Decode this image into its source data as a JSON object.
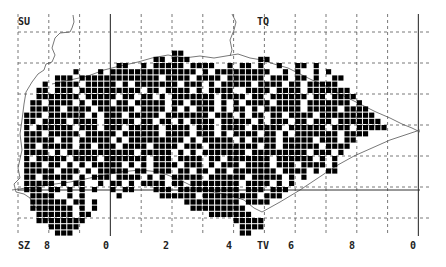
{
  "map": {
    "title": "",
    "grid_labels": {
      "top_left": "SU",
      "top_right": "TQ",
      "bottom_left": "SZ",
      "bottom_right": "TV"
    },
    "x_tick_labels": [
      {
        "text": "8",
        "x": 47
      },
      {
        "text": "0",
        "x": 106
      },
      {
        "text": "2",
        "x": 166
      },
      {
        "text": "4",
        "x": 229
      },
      {
        "text": "6",
        "x": 291
      },
      {
        "text": "8",
        "x": 352
      },
      {
        "text": "0",
        "x": 413
      }
    ],
    "colors": {
      "present": "#000000",
      "grid_dashed": "#555555",
      "grid_solid": "#444444",
      "coast": "#555555",
      "background": "#ffffff"
    },
    "grid": {
      "origin_x": 18,
      "origin_y": 32,
      "square_px_x": 30.8,
      "square_px_y": 31,
      "cells_per_square": 5,
      "vertical_lines": 14,
      "horizontal_lines": 7,
      "solid_vertical_index": [
        3,
        13
      ],
      "solid_horizontal_y": 191
    },
    "tetrad_rows": [
      {
        "row": 3,
        "start": 25,
        "cells": "##"
      },
      {
        "row": 4,
        "start": 22,
        "cells": "##.###...........##"
      },
      {
        "row": 5,
        "start": 14,
        "cells": "..##..#.#####.####..#.##.#..#..##.#"
      },
      {
        "row": 6,
        "start": 9,
        "cells": "#...#.##############.#.#########..#.#..#.#"
      },
      {
        "row": 7,
        "start": 6,
        "cells": "###.#############.####.####.######.###.##.#..##"
      },
      {
        "row": 8,
        "start": 4,
        "cells": "#.####.#####.#.#######.###.#.#####.####.##.#####"
      },
      {
        "row": 9,
        "start": 3,
        "cells": "##.###.##########.##.####.#.####..####.####.#######"
      },
      {
        "row": 10,
        "start": 3,
        "cells": "#######.#####.##.##.#.#######.####.##.######.##.####"
      },
      {
        "row": 11,
        "start": 2,
        "cells": "##.####.#.###.##.#####.##.####.#.#.####.####.#######.#"
      },
      {
        "row": 12,
        "start": 2,
        "cells": "#####.####.######.####.#.#.###.#.##.#.######.#####.####"
      },
      {
        "row": 13,
        "start": 1,
        "cells": "###.######.#.###.#####.#######.###.#.##.##.####.#########"
      },
      {
        "row": 14,
        "start": 1,
        "cells": "##.####.####.#####.##.##.#.####.#####.#.###.##.###.#######"
      },
      {
        "row": 15,
        "start": 1,
        "cells": "#.######.###.###.#####.####.###.####.#####.######.###.#####"
      },
      {
        "row": 16,
        "start": 1,
        "cells": "###.#####.#####.######.####.###.#.####.##.#.#######.####"
      },
      {
        "row": 17,
        "start": 1,
        "cells": "#####.##.#####.#.#########.#.#####.#.####.#####.###.##"
      },
      {
        "row": 18,
        "start": 1,
        "cells": "##.#####.##.###.####.####.###.########.##.######.####"
      },
      {
        "row": 19,
        "start": 1,
        "cells": "####.#.###########.#####.#.#.#######.#########.###.#"
      },
      {
        "row": 20,
        "start": 1,
        "cells": "#.#####.####.#######.###.####.##.#######.######.#.#"
      },
      {
        "row": 21,
        "start": 1,
        "cells": "###.##.#.#.#####.#.#.####.###.#.###.####.###.####.#"
      },
      {
        "row": 22,
        "start": 1,
        "cells": "#####.###.#.#####.##.###.##.##.##.#######.####.#.##"
      },
      {
        "row": 23,
        "start": 1,
        "cells": "##.#####.#.###.####.#.#.#####.######.#####.#.#"
      },
      {
        "row": 24,
        "start": 1,
        "cells": "#####.#.##..#.##.#.####.##.########.####.#.#"
      },
      {
        "row": 25,
        "start": 1,
        "cells": "###.##.#.#.#..#.##...###.##########.###.###"
      },
      {
        "row": 26,
        "start": 2,
        "cells": "####..#.#.....#......######.#########.###"
      },
      {
        "row": 27,
        "start": 2,
        "cells": "######.##.#..............#########.####"
      },
      {
        "row": 28,
        "start": 2,
        "cells": "#######.#.#...............#########"
      },
      {
        "row": 29,
        "start": 3,
        "cells": "######.##...................#######"
      },
      {
        "row": 30,
        "start": 3,
        "cells": "########........................#####"
      },
      {
        "row": 31,
        "start": 5,
        "cells": "#####..........................####"
      },
      {
        "row": 32,
        "start": 6,
        "cells": "###...........................##"
      }
    ]
  }
}
